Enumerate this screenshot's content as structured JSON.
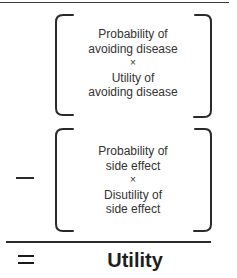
{
  "diagram": {
    "term1": {
      "lines": [
        "Probability of",
        "avoiding disease",
        "×",
        "Utility of",
        "avoiding disease"
      ]
    },
    "operator1": "−",
    "term2": {
      "lines": [
        "Probability of",
        "side effect",
        "×",
        "Disutility of",
        "side effect"
      ]
    },
    "operator2": "=",
    "result": "Utility"
  },
  "colors": {
    "stroke": "#2a2a2a",
    "text": "#333333",
    "background": "#ffffff"
  }
}
